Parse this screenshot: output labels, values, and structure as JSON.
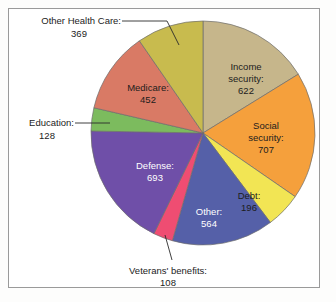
{
  "frame": {
    "border_color": "#9a9a9a",
    "background": "#ffffff"
  },
  "chart_data": {
    "type": "pie",
    "title": "",
    "subtitle": "",
    "xlabel": "",
    "ylabel": "",
    "legend_position": "none",
    "grid": false,
    "units": "billions of dollars",
    "total": 3839,
    "start_angle_deg": 0,
    "direction": "clockwise",
    "categories": [
      "Income security",
      "Social security",
      "Debt",
      "Other",
      "Veterans' benefits",
      "Defense",
      "Education",
      "Medicare",
      "Other Health Care"
    ],
    "values": [
      622,
      707,
      196,
      564,
      108,
      693,
      128,
      452,
      369
    ],
    "colors": [
      "#c6b68b",
      "#f5a03c",
      "#f2e554",
      "#5560a8",
      "#ef4d72",
      "#6f4fa8",
      "#7cbb5e",
      "#d97a65",
      "#c8bb4e"
    ],
    "slices": [
      {
        "name": "Income security",
        "value": 622,
        "color": "#c6b68b",
        "label_lines": [
          "Income",
          "security:",
          "622"
        ],
        "label_placement": "inside",
        "label_color": "dark"
      },
      {
        "name": "Social security",
        "value": 707,
        "color": "#f5a03c",
        "label_lines": [
          "Social",
          "security:",
          "707"
        ],
        "label_placement": "inside",
        "label_color": "dark"
      },
      {
        "name": "Debt",
        "value": 196,
        "color": "#f2e554",
        "label_lines": [
          "Debt:",
          "196"
        ],
        "label_placement": "inside",
        "label_color": "dark"
      },
      {
        "name": "Other",
        "value": 564,
        "color": "#5560a8",
        "label_lines": [
          "Other:",
          "564"
        ],
        "label_placement": "inside",
        "label_color": "light"
      },
      {
        "name": "Veterans' benefits",
        "value": 108,
        "color": "#ef4d72",
        "label_lines": [
          "Veterans' benefits:",
          "108"
        ],
        "label_placement": "outside-callout",
        "label_color": "dark"
      },
      {
        "name": "Defense",
        "value": 693,
        "color": "#6f4fa8",
        "label_lines": [
          "Defense:",
          "693"
        ],
        "label_placement": "inside",
        "label_color": "light"
      },
      {
        "name": "Education",
        "value": 128,
        "color": "#7cbb5e",
        "label_lines": [
          "Education:",
          "128"
        ],
        "label_placement": "outside-callout",
        "label_color": "dark"
      },
      {
        "name": "Medicare",
        "value": 452,
        "color": "#d97a65",
        "label_lines": [
          "Medicare:",
          "452"
        ],
        "label_placement": "inside",
        "label_color": "dark"
      },
      {
        "name": "Other Health Care",
        "value": 369,
        "color": "#c8bb4e",
        "label_lines": [
          "Other Health Care:",
          "369"
        ],
        "label_placement": "outside-callout",
        "label_color": "dark"
      }
    ]
  },
  "labels": {
    "income_security_l1": "Income",
    "income_security_l2": "security:",
    "income_security_l3": "622",
    "social_security_l1": "Social",
    "social_security_l2": "security:",
    "social_security_l3": "707",
    "debt_l1": "Debt:",
    "debt_l2": "196",
    "other_l1": "Other:",
    "other_l2": "564",
    "veterans_l1": "Veterans' benefits:",
    "veterans_l2": "108",
    "defense_l1": "Defense:",
    "defense_l2": "693",
    "education_l1": "Education:",
    "education_l2": "128",
    "medicare_l1": "Medicare:",
    "medicare_l2": "452",
    "other_health_l1": "Other Health Care:",
    "other_health_l2": "369"
  }
}
